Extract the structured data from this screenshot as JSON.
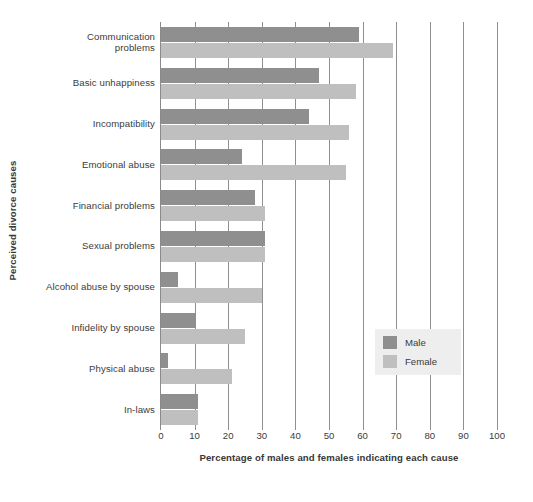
{
  "chart_data": {
    "type": "bar",
    "orientation": "horizontal",
    "title": "",
    "xlabel": "Percentage of males and females indicating each cause",
    "ylabel": "Perceived divorce causes",
    "xlim": [
      0,
      100
    ],
    "xticks": [
      0,
      10,
      20,
      30,
      40,
      50,
      60,
      70,
      80,
      90,
      100
    ],
    "grid": true,
    "grid_axis": "x",
    "legend_position": "center-right",
    "categories": [
      "Communication problems",
      "Basic unhappiness",
      "Incompatibility",
      "Emotional abuse",
      "Financial problems",
      "Sexual problems",
      "Alcohol abuse by spouse",
      "Infidelity by spouse",
      "Physical abuse",
      "In-laws"
    ],
    "series": [
      {
        "name": "Male",
        "color": "#8f8f8f",
        "values": [
          59,
          47,
          44,
          24,
          28,
          31,
          5,
          10,
          2,
          11
        ]
      },
      {
        "name": "Female",
        "color": "#bfbfbf",
        "values": [
          69,
          58,
          56,
          55,
          31,
          31,
          30,
          25,
          21,
          11
        ]
      }
    ]
  },
  "axes": {
    "y_title": "Perceived divorce causes",
    "x_title": "Percentage of males and females indicating each cause",
    "x_tick_labels": [
      "0",
      "10",
      "20",
      "30",
      "40",
      "50",
      "60",
      "70",
      "80",
      "90",
      "100"
    ]
  },
  "category_labels": [
    {
      "line1": "Communication",
      "line2": "problems"
    },
    {
      "line1": "Basic unhappiness",
      "line2": ""
    },
    {
      "line1": "Incompatibility",
      "line2": ""
    },
    {
      "line1": "Emotional abuse",
      "line2": ""
    },
    {
      "line1": "Financial problems",
      "line2": ""
    },
    {
      "line1": "Sexual problems",
      "line2": ""
    },
    {
      "line1": "Alcohol abuse by spouse",
      "line2": ""
    },
    {
      "line1": "Infidelity by spouse",
      "line2": ""
    },
    {
      "line1": "Physical abuse",
      "line2": ""
    },
    {
      "line1": "In-laws",
      "line2": ""
    }
  ],
  "legend": {
    "items": [
      {
        "label": "Male",
        "color": "#8f8f8f"
      },
      {
        "label": "Female",
        "color": "#bfbfbf"
      }
    ]
  }
}
